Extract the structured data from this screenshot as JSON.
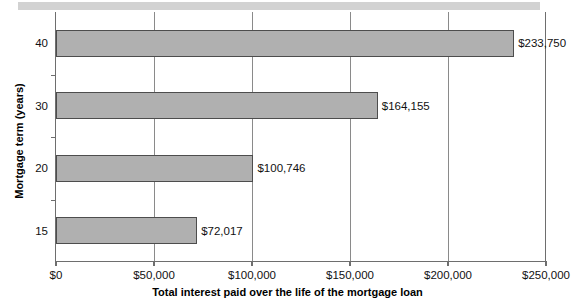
{
  "chart_data": {
    "type": "bar",
    "orientation": "horizontal",
    "title": "",
    "categories": [
      "15",
      "20",
      "30",
      "40"
    ],
    "values": [
      72017,
      100746,
      164155,
      233750
    ],
    "data_labels": [
      "$72,017",
      "$100,746",
      "$164,155",
      "$233,750"
    ],
    "xlabel": "Total interest paid over the life of the mortgage loan",
    "ylabel": "Mortgage term (years)",
    "xlim": [
      0,
      250000
    ],
    "xticks": [
      0,
      50000,
      100000,
      150000,
      200000,
      250000
    ],
    "xtick_labels": [
      "$0",
      "$50,000",
      "$100,000",
      "$150,000",
      "$200,000",
      "$250,000"
    ],
    "ytick_labels": [
      "15",
      "20",
      "30",
      "40"
    ],
    "grid": "vertical",
    "legend": "none",
    "bar_color": "#b0b0b0",
    "bar_edge_color": "#4d4d4d",
    "axis_color": "#6e6e6e",
    "gridline_color": "#8a8a8a",
    "band_color": "#d2d2d2"
  }
}
